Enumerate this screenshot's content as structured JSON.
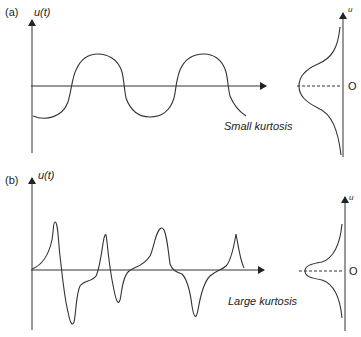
{
  "panels": [
    {
      "id": "a",
      "label": "(a)",
      "y_axis_label": "u(t)",
      "pdf_axis_label": "u",
      "origin_label": "O",
      "caption": "Small kurtosis",
      "signal_type": "sinusoid"
    },
    {
      "id": "b",
      "label": "(b)",
      "y_axis_label": "u(t)",
      "pdf_axis_label": "u",
      "origin_label": "O",
      "caption": "Large kurtosis",
      "signal_type": "intermittent spikes"
    }
  ],
  "colors": {
    "line": "#333333",
    "background": "#ffffff"
  }
}
